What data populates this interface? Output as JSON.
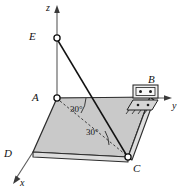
{
  "figure": {
    "type": "engineering-statics-diagram",
    "colors": {
      "plate_fill": "#c9c9c9",
      "plate_edge": "#2a2a2a",
      "axis": "#4a4a4a",
      "line": "#1a1a1a",
      "background": "#ffffff",
      "bracket_fill": "#e8e8e8"
    }
  },
  "axes": {
    "z": {
      "label": "z",
      "label_x": 46,
      "label_y": 3
    },
    "y": {
      "label": "y",
      "label_x": 172,
      "label_y": 101
    },
    "x": {
      "label": "x",
      "label_x": 20,
      "label_y": 178
    }
  },
  "points": {
    "E": {
      "label": "E",
      "label_x": 29,
      "label_y": 31,
      "node_x": 57,
      "node_y": 38
    },
    "A": {
      "label": "A",
      "label_x": 32,
      "label_y": 92,
      "node_x": 57,
      "node_y": 98
    },
    "B": {
      "label": "B",
      "label_x": 148,
      "label_y": 74
    },
    "C": {
      "label": "C",
      "label_x": 133,
      "label_y": 163,
      "node_x": 128,
      "node_y": 157
    },
    "D": {
      "label": "D",
      "label_x": 4,
      "label_y": 148
    }
  },
  "angles": [
    {
      "label": "30°",
      "label_x": 70,
      "label_y": 105
    },
    {
      "label": "30°",
      "label_x": 86,
      "label_y": 128
    }
  ]
}
